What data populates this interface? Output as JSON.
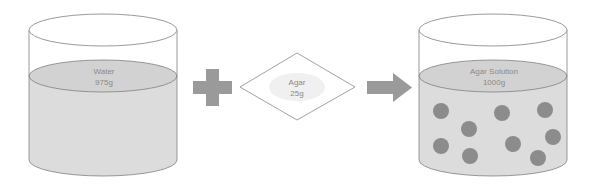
{
  "diagram": {
    "title": "",
    "beaker_water": {
      "label": "Water",
      "mass": "975g"
    },
    "plus_symbol": "+",
    "agar_packet": {
      "label": "Agar",
      "mass": "25g"
    },
    "arrow_symbol": "→",
    "beaker_solution": {
      "label": "Agar Solution",
      "mass": "1000g",
      "particle_count": 9
    },
    "colors": {
      "liquid": "#d9d9d9",
      "surface": "#cfcfcf",
      "outline": "#7f7f7f",
      "symbol": "#9a9a9a",
      "particle": "#8c8c8c",
      "text": "#8a8a8a"
    }
  }
}
